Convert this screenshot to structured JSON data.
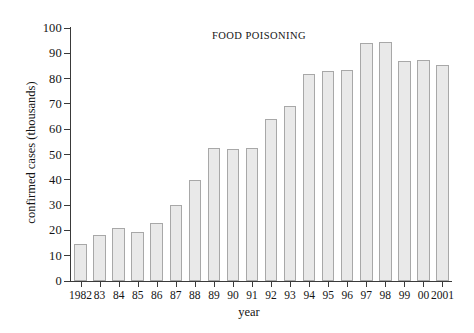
{
  "chart_data": {
    "type": "bar",
    "title": "FOOD POISONING",
    "xlabel": "year",
    "ylabel": "confirmed cases (thousands)",
    "categories": [
      "1982",
      "83",
      "84",
      "85",
      "86",
      "87",
      "88",
      "89",
      "90",
      "91",
      "92",
      "93",
      "94",
      "95",
      "96",
      "97",
      "98",
      "99",
      "00",
      "2001"
    ],
    "values": [
      14.5,
      18,
      21,
      19.5,
      23,
      30,
      40,
      52.5,
      52,
      52.5,
      64,
      69,
      82,
      83,
      83.5,
      94,
      94.5,
      87,
      87.5,
      85.5
    ],
    "ylim": [
      0,
      100
    ],
    "yticks": [
      0,
      10,
      20,
      30,
      40,
      50,
      60,
      70,
      80,
      90,
      100
    ],
    "ytick_labels": [
      "0",
      "10",
      "20",
      "30",
      "40",
      "50",
      "60",
      "70",
      "80",
      "90",
      "100"
    ],
    "grid": false,
    "legend": false,
    "bar_fill_color": "#e9e9e9",
    "bar_edge_color": "#a8a8a8",
    "axis_color": "#3a3a3a"
  }
}
